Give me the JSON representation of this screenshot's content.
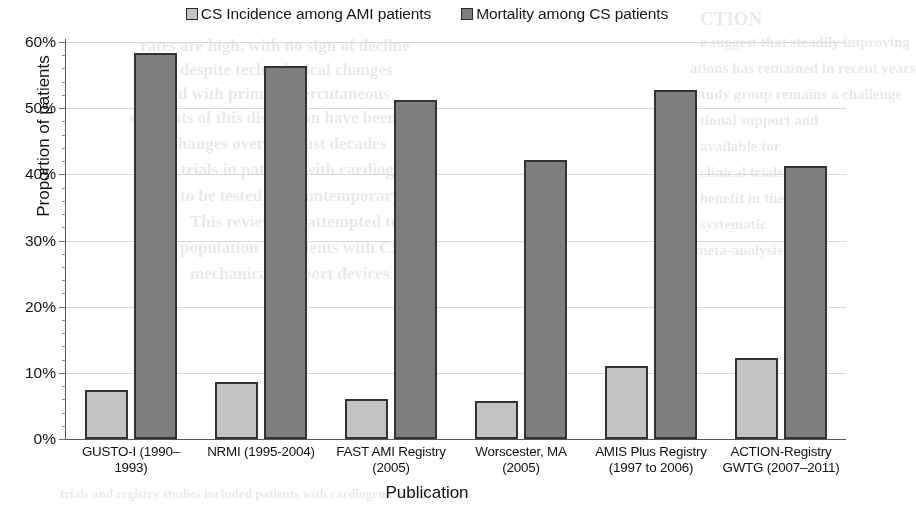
{
  "chart_data": {
    "type": "bar",
    "title": "",
    "xlabel": "Publication",
    "ylabel": "Proportion of patients",
    "ylim": [
      0,
      60
    ],
    "ytick_labels": [
      "0%",
      "10%",
      "20%",
      "30%",
      "40%",
      "50%",
      "60%"
    ],
    "ytick_values": [
      0,
      10,
      20,
      30,
      40,
      50,
      60
    ],
    "y_minor_tick_interval": 2,
    "grid": "horizontal",
    "legend_position": "top-center",
    "categories": [
      "GUSTO-I (1990–1993)",
      "NRMI (1995-2004)",
      "FAST AMI Registry (2005)",
      "Worscester, MA (2005)",
      "AMIS Plus Registry (1997 to 2006)",
      "ACTION-Registry GWTG (2007–2011)"
    ],
    "category_lines": [
      [
        "GUSTO-I (1990–",
        "1993)"
      ],
      [
        "NRMI (1995-2004)"
      ],
      [
        "FAST AMI Registry",
        "(2005)"
      ],
      [
        "Worscester, MA",
        "(2005)"
      ],
      [
        "AMIS Plus Registry",
        "(1997 to 2006)"
      ],
      [
        "ACTION-Registry",
        "GWTG (2007–2011)"
      ]
    ],
    "series": [
      {
        "name": "CS Incidence among AMI patients",
        "color": "#c3c3c3",
        "values": [
          7.4,
          8.6,
          6.0,
          5.7,
          11.0,
          12.3
        ]
      },
      {
        "name": "Mortality among CS patients",
        "color": "#7e7e7e",
        "values": [
          58.4,
          56.4,
          51.3,
          42.1,
          52.8,
          41.2
        ]
      }
    ]
  },
  "legend": {
    "items": [
      {
        "label": "CS Incidence among AMI patients",
        "swatch": "light"
      },
      {
        "label": "Mortality among CS patients",
        "swatch": "dark"
      }
    ]
  },
  "bleed_text": [
    {
      "text": "CTION",
      "x": 700,
      "y": 8,
      "size": 19
    },
    {
      "text": "e suggest that steadily improving",
      "x": 700,
      "y": 34,
      "size": 15
    },
    {
      "text": "ations has remained in recent years",
      "x": 690,
      "y": 60,
      "size": 15
    },
    {
      "text": "rates are high, with no sign of decline",
      "x": 140,
      "y": 36,
      "size": 17
    },
    {
      "text": "despite technological changes",
      "x": 180,
      "y": 60,
      "size": 17
    },
    {
      "text": "and with primary percutaneous",
      "x": 160,
      "y": 84,
      "size": 17
    },
    {
      "text": "elements of this discussion have been",
      "x": 130,
      "y": 108,
      "size": 17
    },
    {
      "text": "ry changes over the past decades",
      "x": 150,
      "y": 134,
      "size": 17
    },
    {
      "text": "in on trials in patients with cardiogenic",
      "x": 140,
      "y": 160,
      "size": 17
    },
    {
      "text": "to be tested in a contemporary",
      "x": 180,
      "y": 186,
      "size": 17
    },
    {
      "text": "This review has attempted to",
      "x": 190,
      "y": 212,
      "size": 17
    },
    {
      "text": "population of patients with CS",
      "x": 180,
      "y": 238,
      "size": 17
    },
    {
      "text": "mechanical support devices",
      "x": 190,
      "y": 264,
      "size": 17
    },
    {
      "text": "study group remains a challenge",
      "x": 695,
      "y": 86,
      "size": 15
    },
    {
      "text": "tional support and",
      "x": 700,
      "y": 112,
      "size": 15
    },
    {
      "text": "available for",
      "x": 700,
      "y": 138,
      "size": 15
    },
    {
      "text": "clinical trials",
      "x": 700,
      "y": 164,
      "size": 15
    },
    {
      "text": "benefit in the",
      "x": 700,
      "y": 190,
      "size": 15
    },
    {
      "text": "systematic",
      "x": 700,
      "y": 216,
      "size": 15
    },
    {
      "text": "meta-analysis",
      "x": 695,
      "y": 242,
      "size": 15
    },
    {
      "text": "trials and registry studies included patients with cardiogenic shock",
      "x": 60,
      "y": 486,
      "size": 13
    }
  ]
}
